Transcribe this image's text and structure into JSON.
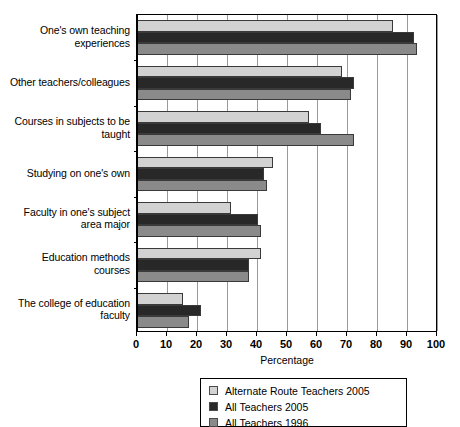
{
  "chart_data": {
    "type": "bar",
    "orientation": "horizontal",
    "title": "",
    "xlabel": "Percentage",
    "ylabel": "",
    "xlim": [
      0,
      100
    ],
    "xticks": [
      0,
      10,
      20,
      30,
      40,
      50,
      60,
      70,
      80,
      90,
      100
    ],
    "grid": true,
    "legend_position": "bottom",
    "categories": [
      "One's own teaching experiences",
      "Other teachers/colleagues",
      "Courses in subjects to be taught",
      "Studying on one's own",
      "Faculty in one's subject area major",
      "Education methods courses",
      "The college of education faculty"
    ],
    "category_lines": [
      [
        "One's own teaching",
        "experiences"
      ],
      [
        "Other teachers/colleagues"
      ],
      [
        "Courses in subjects to be",
        "taught"
      ],
      [
        "Studying on one's own"
      ],
      [
        "Faculty in one's subject",
        "area major"
      ],
      [
        "Education methods",
        "courses"
      ],
      [
        "The college of education",
        "faculty"
      ]
    ],
    "series": [
      {
        "name": "Alternate Route Teachers 2005",
        "color": "#d2d2d2",
        "values": [
          85,
          68,
          57,
          45,
          31,
          41,
          15
        ]
      },
      {
        "name": "All Teachers 2005",
        "color": "#282828",
        "values": [
          92,
          72,
          61,
          42,
          40,
          37,
          21
        ]
      },
      {
        "name": "All Teachers 1996",
        "color": "#8a8a8a",
        "values": [
          93,
          71,
          72,
          43,
          41,
          37,
          17
        ]
      }
    ]
  },
  "legend": {
    "items": [
      {
        "label": "Alternate Route Teachers 2005",
        "color": "#d2d2d2"
      },
      {
        "label": "All Teachers 2005",
        "color": "#282828"
      },
      {
        "label": "All Teachers 1996",
        "color": "#8a8a8a"
      }
    ]
  },
  "axis": {
    "x_title": "Percentage",
    "x_tick_labels": [
      "0",
      "10",
      "20",
      "30",
      "40",
      "50",
      "60",
      "70",
      "80",
      "90",
      "100"
    ]
  }
}
